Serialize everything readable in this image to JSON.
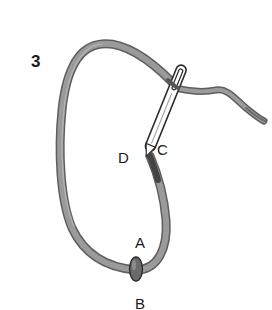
{
  "figure": {
    "step_number": "3",
    "points": {
      "a": "A",
      "b": "B",
      "c": "C",
      "d": "D"
    }
  },
  "colors": {
    "thread": "#8a8a8a",
    "thread_edge": "#5a5a5a",
    "needle_outline": "#2a2a2a",
    "text": "#1a1a1a",
    "background": "#ffffff"
  }
}
